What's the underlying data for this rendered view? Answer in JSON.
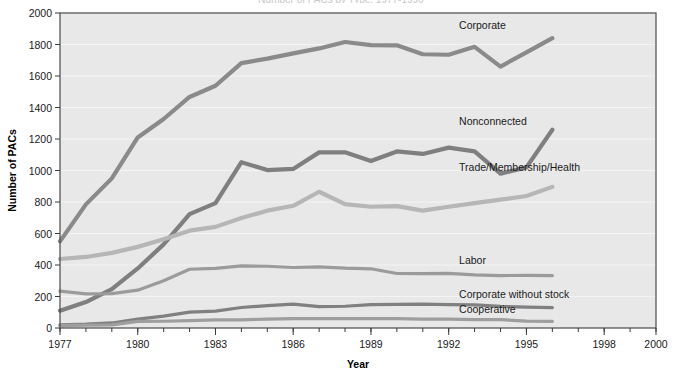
{
  "figure": {
    "clipped_title": "Number of PACs by Type, 1977-1996",
    "background_color": "#ffffff",
    "plot_background_color": "#e8e8e8",
    "plot_border_color": "#4a4a4a"
  },
  "chart_data": {
    "type": "line",
    "title": "",
    "xlabel": "Year",
    "ylabel": "Number of PACs",
    "xlim": [
      1977,
      2000
    ],
    "ylim": [
      0,
      2000
    ],
    "x_ticks": [
      1977,
      1980,
      1983,
      1986,
      1989,
      1992,
      1995,
      1998,
      2000
    ],
    "x_tick_labels": [
      "1977",
      "1980",
      "1983",
      "1986",
      "1989",
      "1992",
      "1995",
      "1998",
      "2000"
    ],
    "x_minor_tick_interval": 1,
    "y_ticks": [
      0,
      200,
      400,
      600,
      800,
      1000,
      1200,
      1400,
      1600,
      1800,
      2000
    ],
    "y_tick_labels": [
      "0",
      "200",
      "400",
      "600",
      "800",
      "1000",
      "1200",
      "1400",
      "1600",
      "1800",
      "2000"
    ],
    "grid": "horizontal",
    "legend_position": "inline-right-labels",
    "x": [
      1977,
      1978,
      1979,
      1980,
      1981,
      1982,
      1983,
      1984,
      1985,
      1986,
      1987,
      1988,
      1989,
      1990,
      1991,
      1992,
      1993,
      1994,
      1995,
      1996
    ],
    "series": [
      {
        "name": "Corporate",
        "color": "#8a8a8a",
        "label": "Corporate",
        "label_x": 1992.4,
        "label_y": 1925,
        "values": [
          550,
          785,
          950,
          1210,
          1327,
          1467,
          1538,
          1682,
          1710,
          1744,
          1775,
          1816,
          1796,
          1795,
          1738,
          1735,
          1785,
          1660,
          1750,
          1840
        ]
      },
      {
        "name": "Nonconnected",
        "color": "#7f7f7f",
        "label": "Nonconnected",
        "label_x": 1992.4,
        "label_y": 1315,
        "values": [
          110,
          165,
          247,
          378,
          531,
          723,
          793,
          1053,
          1003,
          1010,
          1115,
          1116,
          1060,
          1121,
          1105,
          1145,
          1121,
          980,
          1020,
          1259
        ]
      },
      {
        "name": "Trade/Membership/Health",
        "color": "#b6b6b6",
        "label": "Trade/Membership/Health",
        "label_x": 1992.4,
        "label_y": 1022,
        "values": [
          438,
          451,
          477,
          515,
          564,
          618,
          642,
          698,
          745,
          776,
          865,
          786,
          770,
          774,
          745,
          770,
          793,
          815,
          838,
          896
        ]
      },
      {
        "name": "Labor",
        "color": "#9b9b9b",
        "label": "Labor",
        "label_x": 1992.4,
        "label_y": 430,
        "values": [
          234,
          217,
          218,
          240,
          300,
          373,
          378,
          394,
          392,
          384,
          388,
          380,
          376,
          346,
          345,
          347,
          337,
          333,
          334,
          332
        ]
      },
      {
        "name": "Corporate without stock",
        "color": "#808080",
        "label": "Corporate without stock",
        "label_x": 1992.4,
        "label_y": 215,
        "values": [
          20,
          24,
          32,
          56,
          75,
          101,
          107,
          130,
          142,
          151,
          136,
          138,
          148,
          150,
          152,
          149,
          147,
          137,
          132,
          129
        ]
      },
      {
        "name": "Cooperative",
        "color": "#9e9e9e",
        "label": "Cooperative",
        "label_x": 1992.4,
        "label_y": 122,
        "values": [
          15,
          18,
          20,
          42,
          43,
          47,
          51,
          52,
          56,
          60,
          59,
          59,
          59,
          59,
          56,
          56,
          53,
          53,
          44,
          42
        ]
      }
    ]
  }
}
